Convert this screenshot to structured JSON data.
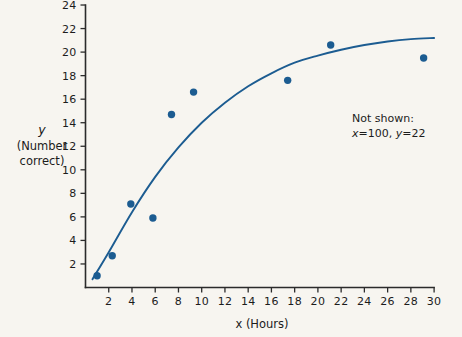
{
  "chart_data": {
    "type": "scatter",
    "title": "",
    "xlabel": "x (Hours)",
    "ylabel": "y (Number correct)",
    "ylabel_line1": "y",
    "ylabel_line2": "(Number",
    "ylabel_line3": "correct)",
    "xlim": [
      0,
      30
    ],
    "ylim": [
      0,
      24
    ],
    "grid": false,
    "legend": null,
    "xticks": [
      2,
      4,
      6,
      8,
      10,
      12,
      14,
      16,
      18,
      20,
      22,
      24,
      26,
      28,
      30
    ],
    "yticks": [
      2,
      4,
      6,
      8,
      10,
      12,
      14,
      16,
      18,
      20,
      22,
      24
    ],
    "xticklabels": [
      "2",
      "4",
      "6",
      "8",
      "10",
      "12",
      "14",
      "16",
      "18",
      "20",
      "22",
      "24",
      "26",
      "28",
      "30"
    ],
    "yticklabels": [
      "2",
      "4",
      "6",
      "8",
      "10",
      "12",
      "14",
      "16",
      "18",
      "20",
      "22",
      "24"
    ],
    "points": [
      {
        "x": 1.0,
        "y": 1.0
      },
      {
        "x": 2.3,
        "y": 2.7
      },
      {
        "x": 3.9,
        "y": 7.1
      },
      {
        "x": 5.8,
        "y": 5.9
      },
      {
        "x": 7.4,
        "y": 14.7
      },
      {
        "x": 9.3,
        "y": 16.6
      },
      {
        "x": 17.4,
        "y": 17.6
      },
      {
        "x": 21.1,
        "y": 20.6
      },
      {
        "x": 29.1,
        "y": 19.5
      }
    ],
    "series": [
      {
        "name": "fitted curve",
        "type": "line",
        "color": "#1c5c91",
        "x": [
          0.6,
          2,
          4,
          6,
          8,
          10,
          12,
          14,
          16,
          18,
          20,
          22,
          24,
          26,
          28,
          30
        ],
        "values": [
          0.7,
          3.0,
          6.4,
          9.4,
          11.9,
          14.0,
          15.7,
          17.1,
          18.2,
          19.1,
          19.7,
          20.2,
          20.6,
          20.9,
          21.1,
          21.2
        ]
      }
    ],
    "annotations": [
      {
        "text_line1": "Not shown:",
        "text_line2": "x=100, y=22",
        "x": 21,
        "y": 13
      }
    ],
    "point_color": "#1c5c91",
    "curve_color": "#1c5c91",
    "background_color": "#f7f5f0",
    "axis_color": "#2b2b2b"
  },
  "annotation": {
    "line1": "Not shown:",
    "line2_var_x": "x",
    "line2_eq1": "=100,",
    "line2_var_y": "y",
    "line2_eq2": "=22"
  }
}
